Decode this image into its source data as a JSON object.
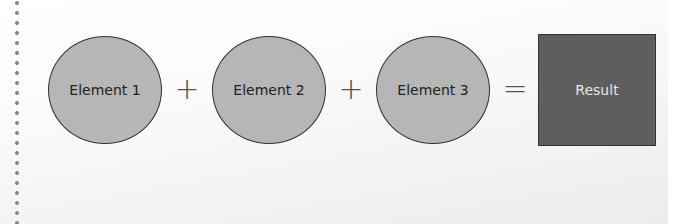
{
  "diagram": {
    "elements": [
      {
        "label": "Element 1"
      },
      {
        "label": "Element 2"
      },
      {
        "label": "Element 3"
      }
    ],
    "operators": [
      "+",
      "+",
      "="
    ],
    "result": {
      "label": "Result"
    },
    "colors": {
      "element_fill": "#b6b6b6",
      "result_fill": "#5e5e5e",
      "stroke": "#333333"
    }
  }
}
